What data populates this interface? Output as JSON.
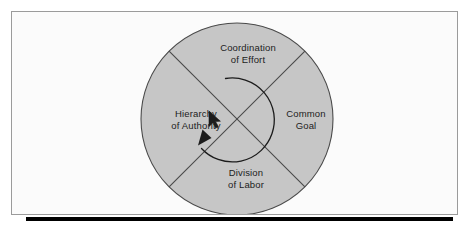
{
  "figure": {
    "shape": "circle-divided-into-four-quadrants",
    "background_color": "#ffffff",
    "frame_color": "#9b9b9b",
    "frame_fill": "#fbfbfb",
    "shadow_bar_color": "#000000",
    "circle": {
      "fill_color": "#c6c6c6",
      "outline_color": "#4a4a4a",
      "center_x": 225,
      "center_y": 107,
      "radius": 96
    },
    "divider": {
      "style": "diagonal-cross",
      "color": "#4a4a4a",
      "description": "Two diagonal lines crossing at the circle center forming four quadrants"
    },
    "rotation_arrow": {
      "color": "#1c1c1c",
      "direction": "clockwise",
      "description": "Curved arrow sweeping around the center, arrowhead pointing up-left toward Hierarchy of Authority"
    },
    "quadrants": [
      {
        "id": "coordination",
        "position": "top",
        "line1": "Coordination",
        "line2": "of Effort"
      },
      {
        "id": "common-goal",
        "position": "right",
        "line1": "Common",
        "line2": "Goal"
      },
      {
        "id": "division",
        "position": "bottom",
        "line1": "Division",
        "line2": "of Labor"
      },
      {
        "id": "hierarchy",
        "position": "left",
        "line1": "Hierarchy",
        "line2": "of Authority"
      }
    ],
    "cursor": {
      "type": "mouse-pointer",
      "x": 207,
      "y": 112
    }
  }
}
